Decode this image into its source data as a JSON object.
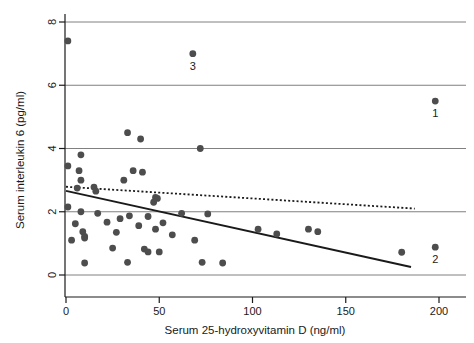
{
  "chart_data": {
    "type": "scatter",
    "title": "",
    "xlabel": "Serum 25-hydroxyvitamin D (ng/ml)",
    "ylabel": "Serum interleukin 6 (pg/ml)",
    "xlim": [
      0,
      200
    ],
    "ylim": [
      0,
      8
    ],
    "xticks": [
      0,
      50,
      100,
      150,
      200
    ],
    "yticks": [
      0,
      2,
      4,
      6,
      8
    ],
    "xtick_labels": [
      "0",
      "50",
      "100",
      "150",
      "200"
    ],
    "ytick_labels": [
      "0",
      "2",
      "4",
      "6",
      "8"
    ],
    "grid": "horizontal",
    "legend": "none",
    "marker_color": "#4d4d4d",
    "line_color": "#1a1a1a",
    "grid_color": "#808080",
    "points": [
      {
        "x": 1,
        "y": 7.4
      },
      {
        "x": 68,
        "y": 7.0,
        "label": "3"
      },
      {
        "x": 198,
        "y": 5.5,
        "label": "1"
      },
      {
        "x": 33,
        "y": 4.5
      },
      {
        "x": 40,
        "y": 4.3
      },
      {
        "x": 72,
        "y": 4.0
      },
      {
        "x": 8,
        "y": 3.8
      },
      {
        "x": 1,
        "y": 3.45
      },
      {
        "x": 7,
        "y": 3.3
      },
      {
        "x": 36,
        "y": 3.3
      },
      {
        "x": 41,
        "y": 3.25
      },
      {
        "x": 8,
        "y": 3.0
      },
      {
        "x": 31,
        "y": 3.0
      },
      {
        "x": 6,
        "y": 2.75
      },
      {
        "x": 15,
        "y": 2.78
      },
      {
        "x": 16,
        "y": 2.65
      },
      {
        "x": 48,
        "y": 2.45
      },
      {
        "x": 49,
        "y": 2.42
      },
      {
        "x": 47,
        "y": 2.3
      },
      {
        "x": 1,
        "y": 2.15
      },
      {
        "x": 8,
        "y": 2.0
      },
      {
        "x": 17,
        "y": 1.95
      },
      {
        "x": 62,
        "y": 1.95
      },
      {
        "x": 76,
        "y": 1.93
      },
      {
        "x": 34,
        "y": 1.87
      },
      {
        "x": 44,
        "y": 1.85
      },
      {
        "x": 29,
        "y": 1.78
      },
      {
        "x": 5,
        "y": 1.62
      },
      {
        "x": 22,
        "y": 1.67
      },
      {
        "x": 52,
        "y": 1.65
      },
      {
        "x": 39,
        "y": 1.56
      },
      {
        "x": 103,
        "y": 1.45
      },
      {
        "x": 130,
        "y": 1.45
      },
      {
        "x": 48,
        "y": 1.45
      },
      {
        "x": 135,
        "y": 1.37
      },
      {
        "x": 9,
        "y": 1.37
      },
      {
        "x": 27,
        "y": 1.35
      },
      {
        "x": 113,
        "y": 1.3
      },
      {
        "x": 10,
        "y": 1.22
      },
      {
        "x": 57,
        "y": 1.27
      },
      {
        "x": 3,
        "y": 1.1
      },
      {
        "x": 10,
        "y": 1.17
      },
      {
        "x": 69,
        "y": 1.1
      },
      {
        "x": 198,
        "y": 0.88,
        "label": "2"
      },
      {
        "x": 25,
        "y": 0.85
      },
      {
        "x": 42,
        "y": 0.82
      },
      {
        "x": 44,
        "y": 0.73
      },
      {
        "x": 50,
        "y": 0.73
      },
      {
        "x": 180,
        "y": 0.72
      },
      {
        "x": 10,
        "y": 0.38
      },
      {
        "x": 33,
        "y": 0.4
      },
      {
        "x": 73,
        "y": 0.4
      },
      {
        "x": 84,
        "y": 0.38
      }
    ],
    "lines": [
      {
        "name": "solid-regression-line",
        "style": "solid",
        "x0": 0,
        "y0": 2.66,
        "x1": 185,
        "y1": 0.25
      },
      {
        "name": "dotted-regression-line",
        "style": "dotted",
        "x0": 0,
        "y0": 2.79,
        "x1": 187,
        "y1": 2.1
      }
    ],
    "point_labels": [
      {
        "text": "3",
        "x": 68,
        "y": 7.0
      },
      {
        "text": "1",
        "x": 198,
        "y": 5.5
      },
      {
        "text": "2",
        "x": 198,
        "y": 0.88
      }
    ]
  }
}
